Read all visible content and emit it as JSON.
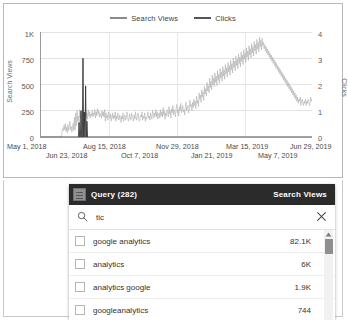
{
  "chart_data": {
    "type": "line",
    "title": "",
    "xlabel": "",
    "legend_position": "top-center",
    "grid": true,
    "legend": [
      {
        "name": "Search Views",
        "color": "#a8a8a8"
      },
      {
        "name": "Clicks",
        "color": "#333333"
      }
    ],
    "axes": {
      "left": {
        "label": "Search Views",
        "ticks": [
          "0",
          "250",
          "500",
          "750",
          "1K"
        ],
        "ylim": [
          0,
          1000
        ]
      },
      "right": {
        "label": "Clicks",
        "ticks": [
          "0",
          "1",
          "2",
          "3",
          "4"
        ],
        "ylim": [
          0,
          4
        ]
      },
      "x": {
        "ticks": [
          "May 1, 2018",
          "Jun 23, 2018",
          "Aug 15, 2018",
          "Oct 7, 2018",
          "Nov 29, 2018",
          "Jan 21, 2019",
          "Mar 15, 2019",
          "May 7, 2019",
          "Jun 29, 2019"
        ]
      }
    },
    "series": [
      {
        "name": "Search Views",
        "axis": "left",
        "color": "#a8a8a8",
        "values": [
          0,
          0,
          0,
          0,
          0,
          0,
          0,
          0,
          0,
          0,
          0,
          0,
          0,
          0,
          0,
          0,
          0,
          0,
          0,
          0,
          0,
          0,
          0,
          0,
          0,
          0,
          0,
          0,
          0,
          0,
          0,
          0,
          45,
          80,
          60,
          110,
          70,
          130,
          55,
          95,
          40,
          120,
          60,
          90,
          150,
          70,
          100,
          45,
          80,
          130,
          60,
          190,
          70,
          230,
          110,
          250,
          150,
          200,
          120,
          260,
          180,
          230,
          140,
          270,
          200,
          240,
          160,
          210,
          250,
          190,
          230,
          170,
          260,
          200,
          240,
          180,
          220,
          200,
          250,
          190,
          230,
          210,
          260,
          180,
          240,
          200,
          270,
          220,
          250,
          190,
          230,
          210,
          180,
          250,
          200,
          240,
          190,
          260,
          150,
          230,
          180,
          210,
          160,
          240,
          200,
          180,
          220,
          150,
          190,
          230,
          170,
          210,
          180,
          240,
          150,
          200,
          170,
          230,
          190,
          160,
          210,
          180,
          140,
          200,
          170,
          230,
          150,
          190,
          210,
          160,
          180,
          240,
          200,
          150,
          170,
          220,
          190,
          160,
          230,
          200,
          180,
          150,
          210,
          170,
          240,
          190,
          160,
          200,
          230,
          180,
          150,
          170,
          210,
          190,
          240,
          160,
          200,
          180,
          230,
          150,
          190,
          170,
          210,
          240,
          180,
          200,
          160,
          230,
          190,
          170,
          250,
          210,
          180,
          230,
          200,
          260,
          190,
          240,
          170,
          210,
          230,
          180,
          260,
          200,
          240,
          190,
          280,
          210,
          250,
          170,
          230,
          200,
          260,
          240,
          190,
          290,
          220,
          250,
          180,
          270,
          230,
          300,
          210,
          260,
          240,
          190,
          280,
          310,
          230,
          260,
          200,
          290,
          250,
          320,
          230,
          270,
          300,
          240,
          260,
          210,
          290,
          330,
          250,
          280,
          300,
          230,
          270,
          350,
          290,
          310,
          250,
          330,
          280,
          360,
          300,
          340,
          270,
          390,
          320,
          350,
          290,
          420,
          360,
          400,
          330,
          450,
          380,
          430,
          350,
          480,
          410,
          460,
          390,
          520,
          440,
          490,
          420,
          560,
          470,
          530,
          450,
          590,
          500,
          560,
          480,
          610,
          520,
          580,
          490,
          630,
          540,
          600,
          510,
          650,
          560,
          620,
          530,
          670,
          580,
          640,
          550,
          690,
          600,
          660,
          570,
          710,
          620,
          680,
          590,
          730,
          640,
          700,
          610,
          750,
          660,
          720,
          630,
          770,
          680,
          740,
          650,
          790,
          700,
          760,
          670,
          810,
          720,
          780,
          690,
          830,
          740,
          800,
          710,
          850,
          760,
          820,
          730,
          870,
          780,
          840,
          750,
          890,
          800,
          860,
          770,
          910,
          820,
          880,
          790,
          930,
          840,
          900,
          810,
          950,
          860,
          920,
          830,
          940,
          870,
          900,
          840,
          880,
          820,
          860,
          800,
          840,
          780,
          820,
          760,
          800,
          740,
          780,
          720,
          760,
          700,
          740,
          680,
          720,
          660,
          700,
          640,
          680,
          620,
          660,
          600,
          640,
          580,
          620,
          560,
          600,
          540,
          580,
          520,
          560,
          500,
          540,
          480,
          520,
          460,
          500,
          440,
          480,
          420,
          460,
          400,
          440,
          380,
          420,
          360,
          400,
          340,
          380,
          320,
          360,
          340,
          380,
          300,
          340,
          360,
          320,
          300,
          340,
          320,
          360,
          300,
          340,
          320,
          360,
          340,
          300,
          320,
          380,
          340,
          360
        ]
      },
      {
        "name": "Clicks",
        "axis": "right",
        "color": "#333333",
        "spikes": [
          {
            "index": 64,
            "value": 3.0
          },
          {
            "index": 68,
            "value": 1.95
          },
          {
            "index": 61,
            "value": 1.0
          },
          {
            "index": 66,
            "value": 0.95
          },
          {
            "index": 70,
            "value": 0.6
          },
          {
            "index": 58,
            "value": 0.55
          }
        ]
      }
    ]
  },
  "panel": {
    "header": {
      "icon": "filter-icon",
      "title": "Query (282)",
      "metric": "Search Views"
    },
    "search": {
      "icon": "search-icon",
      "value": "tic",
      "placeholder": "",
      "clear_icon": "close-icon"
    },
    "rows": [
      {
        "label": "google analytics",
        "value": "82.1K",
        "checked": false
      },
      {
        "label": "analytics",
        "value": "6K",
        "checked": false
      },
      {
        "label": "analytics google",
        "value": "1.9K",
        "checked": false
      },
      {
        "label": "googleanalytics",
        "value": "744",
        "checked": false
      }
    ],
    "scrollbar": {
      "up_arrow": "caret-up-icon"
    }
  }
}
